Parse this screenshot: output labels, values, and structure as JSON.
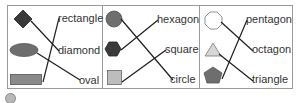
{
  "diagram": {
    "type": "matching-exercise",
    "colors": {
      "border": "#9a9a9a",
      "dark_fill": "#3a3a3a",
      "mid_fill": "#6e6e6e",
      "light_fill": "#bdbdbd",
      "line": "#1e1e1e"
    },
    "panels": [
      {
        "shapes": [
          "diamond",
          "oval",
          "rectangle"
        ],
        "labels": [
          "rectangle",
          "diamond",
          "oval"
        ],
        "matches": [
          [
            "diamond",
            "diamond"
          ],
          [
            "oval",
            "oval"
          ],
          [
            "rectangle",
            "rectangle"
          ]
        ]
      },
      {
        "shapes": [
          "circle",
          "hexagon",
          "square"
        ],
        "labels": [
          "hexagon",
          "square",
          "circle"
        ],
        "matches": [
          [
            "circle",
            "circle"
          ],
          [
            "hexagon",
            "hexagon"
          ],
          [
            "square",
            "square"
          ]
        ]
      },
      {
        "shapes": [
          "octagon",
          "triangle",
          "pentagon"
        ],
        "labels": [
          "pentagon",
          "octagon",
          "triangle"
        ],
        "matches": [
          [
            "octagon",
            "octagon"
          ],
          [
            "triangle",
            "triangle"
          ],
          [
            "pentagon",
            "pentagon"
          ]
        ]
      }
    ]
  }
}
